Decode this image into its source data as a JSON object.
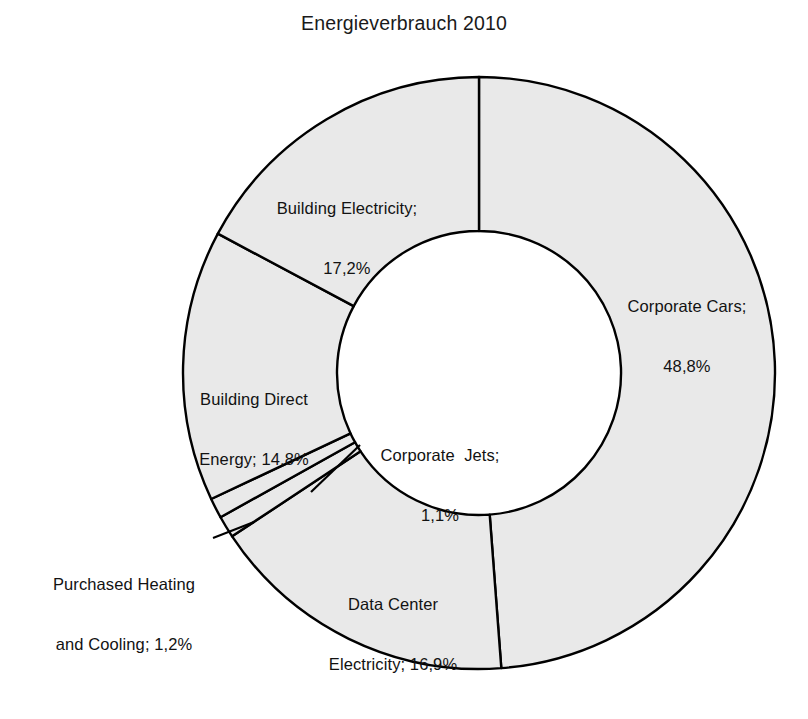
{
  "chart_data": {
    "type": "pie",
    "variant": "donut",
    "title": "Energieverbrauch 2010",
    "xlabel": "",
    "ylabel": "",
    "units": "percent",
    "decimal_separator": ",",
    "legend": "none (labels placed on slices)",
    "grid": false,
    "start_angle_deg": 0,
    "direction": "clockwise",
    "categories": [
      "Corporate Cars",
      "Data Center Electricity",
      "Purchased Heating and Cooling",
      "Corporate Jets",
      "Building Direct Energy",
      "Building Electricity"
    ],
    "values": [
      48.8,
      16.9,
      1.2,
      1.1,
      14.8,
      17.2
    ],
    "value_labels": [
      "48,8%",
      "16,9%",
      "1,2%",
      "1,1%",
      "14,8%",
      "17,2%"
    ],
    "slices": [
      {
        "name": "Corporate Cars",
        "value": 48.8,
        "value_label": "48,8%",
        "label_line1": "Corporate Cars;",
        "label_line2": "48,8%",
        "fill": "#e9e9e9",
        "stroke": "#000000",
        "leader_line": false
      },
      {
        "name": "Data Center Electricity",
        "value": 16.9,
        "value_label": "16,9%",
        "label_line1": "Data Center",
        "label_line2": "Electricity; 16,9%",
        "fill": "#e9e9e9",
        "stroke": "#000000",
        "leader_line": false
      },
      {
        "name": "Purchased Heating and Cooling",
        "value": 1.2,
        "value_label": "1,2%",
        "label_line1": "Purchased Heating",
        "label_line2": "and Cooling; 1,2%",
        "fill": "#e9e9e9",
        "stroke": "#000000",
        "leader_line": true
      },
      {
        "name": "Corporate Jets",
        "value": 1.1,
        "value_label": "1,1%",
        "label_line1": "Corporate  Jets;",
        "label_line2": "1,1%",
        "fill": "#e9e9e9",
        "stroke": "#000000",
        "leader_line": true
      },
      {
        "name": "Building Direct Energy",
        "value": 14.8,
        "value_label": "14,8%",
        "label_line1": "Building Direct",
        "label_line2": "Energy; 14,8%",
        "fill": "#e9e9e9",
        "stroke": "#000000",
        "leader_line": false
      },
      {
        "name": "Building Electricity",
        "value": 17.2,
        "value_label": "17,2%",
        "label_line1": "Building Electricity;",
        "label_line2": "17,2%",
        "fill": "#e9e9e9",
        "stroke": "#000000",
        "leader_line": false
      }
    ],
    "colors": {
      "slice_fill": "#e9e9e9",
      "slice_stroke": "#000000",
      "background": "#ffffff",
      "text": "#121212"
    }
  },
  "page": {
    "background": "#ffffff",
    "caption_remnant": ""
  }
}
